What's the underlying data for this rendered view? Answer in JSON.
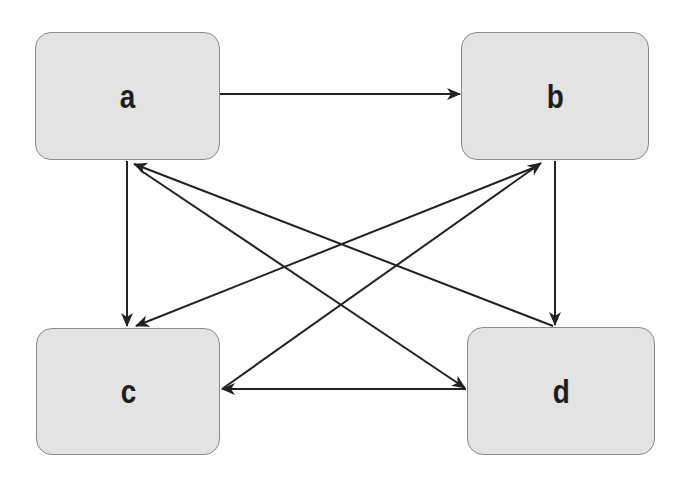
{
  "diagram": {
    "type": "directed-graph",
    "nodes": [
      {
        "id": "a",
        "label": "a",
        "x": 35,
        "y": 32,
        "w": 185,
        "h": 128
      },
      {
        "id": "b",
        "label": "b",
        "x": 461,
        "y": 32,
        "w": 188,
        "h": 128
      },
      {
        "id": "c",
        "label": "c",
        "x": 36,
        "y": 328,
        "w": 184,
        "h": 127
      },
      {
        "id": "d",
        "label": "d",
        "x": 467,
        "y": 327,
        "w": 188,
        "h": 128
      }
    ],
    "edges": [
      {
        "from": "a",
        "to": "b"
      },
      {
        "from": "a",
        "to": "c"
      },
      {
        "from": "a",
        "to": "d"
      },
      {
        "from": "b",
        "to": "c"
      },
      {
        "from": "b",
        "to": "d"
      },
      {
        "from": "c",
        "to": "b"
      },
      {
        "from": "d",
        "to": "a"
      },
      {
        "from": "d",
        "to": "c"
      }
    ],
    "colors": {
      "node_fill": "#e3e3e3",
      "node_border": "#8a8a8a",
      "edge": "#222222"
    }
  }
}
